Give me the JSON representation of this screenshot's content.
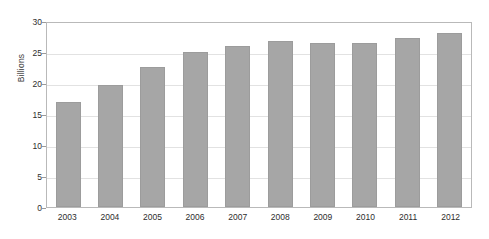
{
  "chart_data": {
    "type": "bar",
    "title": "",
    "xlabel": "",
    "ylabel": "Billions",
    "categories": [
      "2003",
      "2004",
      "2005",
      "2006",
      "2007",
      "2008",
      "2009",
      "2010",
      "2011",
      "2012"
    ],
    "values": [
      17.0,
      19.7,
      22.6,
      25.0,
      26.0,
      26.7,
      26.4,
      26.5,
      27.2,
      28.0
    ],
    "ylim": [
      0,
      30
    ],
    "yticks": [
      0,
      5,
      10,
      15,
      20,
      25,
      30
    ],
    "ytick_labels": [
      "0",
      "5",
      "10",
      "15",
      "20",
      "25",
      "30"
    ],
    "grid": true,
    "legend": "none",
    "series": [
      {
        "name": "Billions",
        "values": [
          17.0,
          19.7,
          22.6,
          25.0,
          26.0,
          26.7,
          26.4,
          26.5,
          27.2,
          28.0
        ]
      }
    ],
    "colors": {
      "bar_fill": "#a6a6a6",
      "bar_border": "#9c9c9c",
      "gridline": "#e2e2e2",
      "plot_border": "#b9b9b9",
      "text": "#2e2e2e",
      "background": "#ffffff"
    }
  }
}
